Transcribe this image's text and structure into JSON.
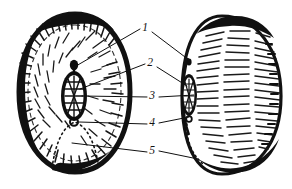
{
  "figure": {
    "background_color": "#ffffff",
    "ink_color": "#101010",
    "width": 292,
    "height": 189
  },
  "labels": [
    {
      "id": "1",
      "text": "1",
      "x": 145,
      "y": 31
    },
    {
      "id": "2",
      "text": "2",
      "x": 150,
      "y": 66
    },
    {
      "id": "3",
      "text": "3",
      "x": 152,
      "y": 99
    },
    {
      "id": "4",
      "text": "4",
      "x": 152,
      "y": 126
    },
    {
      "id": "5",
      "text": "5",
      "x": 152,
      "y": 154
    }
  ],
  "objects": [
    {
      "id": "left-specimen",
      "name": "sectioned-seed-left",
      "description": "Large oval seed shown in section with thick dark rind, radial hatching, central dark hilum structure and dotted internal arc"
    },
    {
      "id": "right-specimen",
      "name": "whole-seed-right",
      "description": "Oval seed shown from the side with horizontal hatching, small dark hilum on left margin and dotted margin curve"
    }
  ]
}
